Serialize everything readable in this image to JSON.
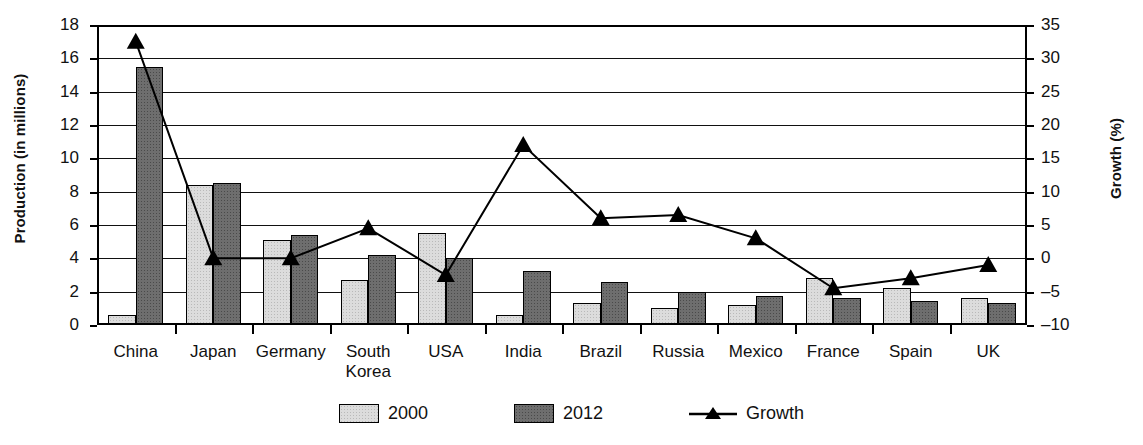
{
  "chart_data": {
    "type": "bar",
    "title": "",
    "subtitle": "",
    "xlabel": "",
    "ylabel": "Production (in millions)",
    "y2label": "Growth (%)",
    "grid": true,
    "legend_position": "bottom",
    "categories": [
      "China",
      "Japan",
      "Germany",
      "South Korea",
      "USA",
      "India",
      "Brazil",
      "Russia",
      "Mexico",
      "France",
      "Spain",
      "UK"
    ],
    "category_lines": [
      [
        "China"
      ],
      [
        "Japan"
      ],
      [
        "Germany"
      ],
      [
        "South",
        "Korea"
      ],
      [
        "USA"
      ],
      [
        "India"
      ],
      [
        "Brazil"
      ],
      [
        "Russia"
      ],
      [
        "Mexico"
      ],
      [
        "France"
      ],
      [
        "Spain"
      ],
      [
        "UK"
      ]
    ],
    "ylim": [
      0,
      18
    ],
    "yticks": [
      0,
      2,
      4,
      6,
      8,
      10,
      12,
      14,
      16,
      18
    ],
    "y2lim": [
      -10,
      35
    ],
    "y2ticks": [
      -10,
      -5,
      0,
      5,
      10,
      15,
      20,
      25,
      30,
      35
    ],
    "y2ticklabels": [
      "–10",
      "–5",
      "0",
      "5",
      "10",
      "15",
      "20",
      "25",
      "30",
      "35"
    ],
    "series": [
      {
        "name": "2000",
        "axis": "left",
        "type": "bar",
        "color": "#dcdcdc",
        "values": [
          0.6,
          8.4,
          5.1,
          2.7,
          5.5,
          0.6,
          1.35,
          1.0,
          1.2,
          2.8,
          2.2,
          1.65
        ]
      },
      {
        "name": "2012",
        "axis": "left",
        "type": "bar",
        "color": "#6e6e6e",
        "values": [
          15.5,
          8.5,
          5.4,
          4.2,
          4.0,
          3.25,
          2.6,
          2.0,
          1.75,
          1.6,
          1.45,
          1.3
        ]
      },
      {
        "name": "Growth",
        "axis": "right",
        "type": "line",
        "color": "#000000",
        "values": [
          32.5,
          0.0,
          0.0,
          4.5,
          -2.5,
          17.0,
          6.0,
          6.5,
          3.0,
          -4.5,
          -3.0,
          -1.0
        ]
      }
    ]
  },
  "legend": {
    "items": [
      {
        "label": "2000",
        "kind": "swatch-light"
      },
      {
        "label": "2012",
        "kind": "swatch-dark"
      },
      {
        "label": "Growth",
        "kind": "line-marker"
      }
    ]
  }
}
